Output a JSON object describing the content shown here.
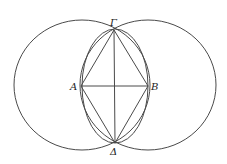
{
  "diagram": {
    "type": "geometric-construction",
    "colors": {
      "stroke": "#4a4a4a",
      "label": "#222222",
      "background": "#ffffff"
    },
    "points": {
      "A": {
        "label": "A",
        "x": 81,
        "y": 86
      },
      "B": {
        "label": "B",
        "x": 148,
        "y": 86
      },
      "Gamma": {
        "label": "Γ",
        "x": 114,
        "y": 30
      },
      "Delta": {
        "label": "Δ",
        "x": 115,
        "y": 143
      }
    },
    "circles": [
      {
        "name": "circle-left",
        "cx": 82,
        "cy": 85,
        "rx": 68,
        "ry": 65
      },
      {
        "name": "circle-right",
        "cx": 148,
        "cy": 85,
        "rx": 68,
        "ry": 65
      },
      {
        "name": "lens-ellipse",
        "cx": 115,
        "cy": 86,
        "rx": 33,
        "ry": 57
      }
    ],
    "segments": [
      [
        "A",
        "B"
      ],
      [
        "Gamma",
        "Delta"
      ],
      [
        "Gamma",
        "A"
      ],
      [
        "Gamma",
        "B"
      ],
      [
        "A",
        "Delta"
      ],
      [
        "B",
        "Delta"
      ]
    ],
    "labels": {
      "A": "A",
      "B": "B",
      "Gamma": "Γ",
      "Delta": "Δ"
    }
  }
}
